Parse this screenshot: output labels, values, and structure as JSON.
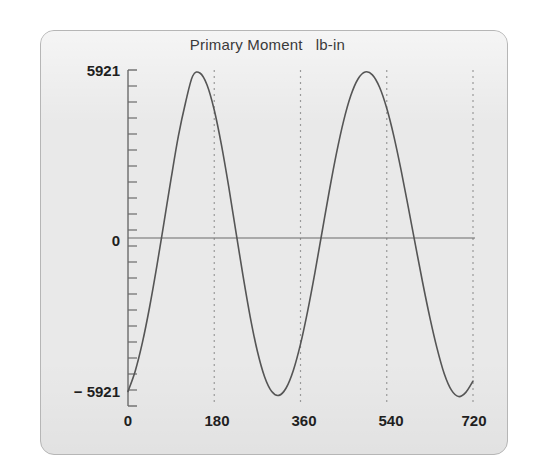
{
  "panel": {
    "background_color": "#e9e9e9",
    "border_color": "#b6b6b6"
  },
  "chart_data": {
    "type": "line",
    "title": "Primary Moment   lb-in",
    "title_text": "Primary Moment",
    "units": "lb-in",
    "xlabel": "",
    "ylabel": "",
    "xlim": [
      0,
      720
    ],
    "ylim": [
      -5921,
      5921
    ],
    "grid": false,
    "legend": null,
    "line_color": "#555555",
    "axis_color": "#6b6b6b",
    "gridline_style": "dotted",
    "gridline_color": "#9a9a9a",
    "x_ticks": [
      0,
      180,
      360,
      540,
      720
    ],
    "x_ticklabels": [
      "0",
      "180",
      "360",
      "540",
      "720"
    ],
    "y_ticklabels": [
      "5921",
      "0",
      "− 5921"
    ],
    "y_tick_values": [
      5921,
      0,
      -5921
    ],
    "y_minor_tick_count": 21,
    "vertical_dashed_lines_at": [
      180,
      360,
      540,
      720
    ],
    "peak_value": 5921,
    "trough_value": -5921,
    "period_degrees": 360,
    "phase_note": "peaks near 135 and 495 degrees, troughs near 307 and 667 degrees",
    "series": [
      {
        "name": "Primary Moment",
        "x": [
          0,
          15,
          30,
          45,
          60,
          75,
          90,
          105,
          120,
          135,
          150,
          165,
          180,
          195,
          210,
          225,
          240,
          255,
          270,
          285,
          300,
          315,
          330,
          345,
          360,
          375,
          390,
          405,
          420,
          435,
          450,
          465,
          480,
          495,
          510,
          525,
          540,
          555,
          570,
          585,
          600,
          615,
          630,
          645,
          660,
          675,
          690,
          705,
          720
        ],
        "y": [
          -5471,
          -4752,
          -3734,
          -2470,
          -1022,
          540,
          2124,
          3622,
          4825,
          5779,
          5887,
          5460,
          4567,
          3323,
          1849,
          247,
          -1344,
          -2810,
          -4041,
          -4949,
          -5479,
          -5613,
          -5350,
          -4724,
          -3785,
          -2597,
          -1241,
          214,
          1667,
          3016,
          4177,
          5080,
          5672,
          5921,
          5818,
          5375,
          4625,
          3617,
          2414,
          1094,
          -266,
          -1596,
          -2838,
          -3936,
          -4842,
          -5428,
          -5655,
          -5507,
          -5104
        ]
      }
    ]
  },
  "x_axis": {
    "labels": [
      "0",
      "180",
      "360",
      "540",
      "720"
    ]
  },
  "y_axis": {
    "top_label": "5921",
    "zero_label": "0",
    "bottom_label": "− 5921"
  }
}
